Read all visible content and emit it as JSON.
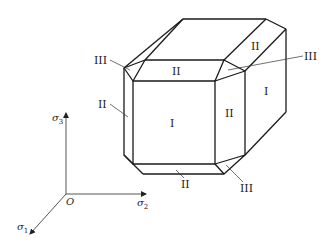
{
  "figure": {
    "face_labels": {
      "front": "I",
      "right_side": "I",
      "top_front": "II",
      "top_right": "II",
      "front_right": "II",
      "left": "II",
      "bottom": "II",
      "corner_top_left": "III",
      "corner_top_right": "III",
      "corner_bottom_right": "III"
    },
    "axes": {
      "origin": "O",
      "vertical": "σ3",
      "horizontal": "σ2",
      "diagonal": "σ1"
    }
  }
}
